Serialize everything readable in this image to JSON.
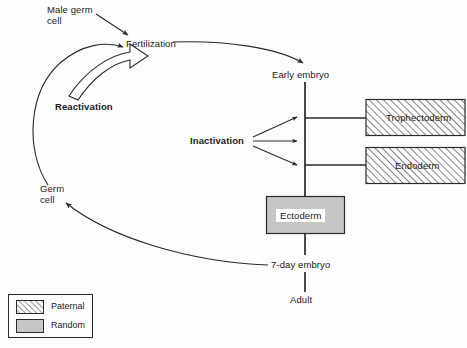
{
  "diagram": {
    "nodes": [
      {
        "id": "male-germ-cell",
        "label": "Male germ\ncell",
        "line1": "Male germ",
        "line2": "cell",
        "x": 47,
        "y": 6
      },
      {
        "id": "fertilization",
        "label": "Fertilization",
        "x": 126,
        "y": 39
      },
      {
        "id": "early-embryo",
        "label": "Early embryo",
        "x": 272,
        "y": 70
      },
      {
        "id": "germ-cell",
        "label": "Germ\ncell",
        "line1": "Germ",
        "line2": "cell",
        "x": 40,
        "y": 186
      },
      {
        "id": "seven-day-embryo",
        "label": "7-day embryo",
        "x": 272,
        "y": 260
      },
      {
        "id": "adult",
        "label": "Adult",
        "x": 290,
        "y": 295
      }
    ],
    "process_labels": [
      {
        "id": "reactivation",
        "label": "Reactivation",
        "bold": true,
        "x": 55,
        "y": 101
      },
      {
        "id": "inactivation",
        "label": "Inactivation",
        "bold": true,
        "x": 190,
        "y": 135
      }
    ],
    "boxes": [
      {
        "id": "trophectoderm",
        "label": "Trophectoderm",
        "fill": "paternal",
        "x": 365,
        "y": 99,
        "w": 100,
        "h": 37
      },
      {
        "id": "endoderm",
        "label": "Endoderm",
        "fill": "paternal",
        "x": 365,
        "y": 147,
        "w": 100,
        "h": 37
      },
      {
        "id": "ectoderm",
        "label": "Ectoderm",
        "fill": "random",
        "x": 266,
        "y": 196,
        "w": 79,
        "h": 38
      }
    ]
  },
  "legend": {
    "items": [
      {
        "id": "paternal",
        "label": "Paternal",
        "fill": "paternal"
      },
      {
        "id": "random",
        "label": "Random",
        "fill": "random"
      }
    ]
  },
  "colors": {
    "stroke": "#2a2a2a",
    "hatch": "#555555",
    "random_fill": "#c6c6c6",
    "box_border": "#2a2a2a",
    "background": "#fdfdfd",
    "text": "#1b1b1b"
  }
}
